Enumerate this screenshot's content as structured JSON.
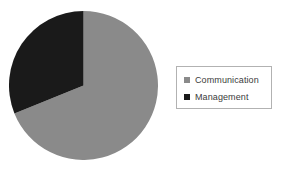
{
  "chart_data": {
    "type": "pie",
    "title": "",
    "categories": [
      "Communication",
      "Management"
    ],
    "values": [
      69,
      31
    ],
    "unit": "percent",
    "colors": [
      "#8a8a8a",
      "#1a1a1a"
    ],
    "start_angle_deg": 0,
    "direction": "clockwise",
    "slices": [
      {
        "label": "Communication",
        "value": 69,
        "color": "#8a8a8a",
        "start_angle_deg": 0,
        "sweep_angle_deg": 248
      },
      {
        "label": "Management",
        "value": 31,
        "color": "#1a1a1a",
        "start_angle_deg": 248,
        "sweep_angle_deg": 112
      }
    ],
    "legend": {
      "position": "right",
      "border": true,
      "entries": [
        {
          "label": "Communication",
          "marker": "square",
          "color": "#8a8a8a"
        },
        {
          "label": "Management",
          "marker": "square",
          "color": "#1a1a1a"
        }
      ]
    },
    "grid": false,
    "xlabel": "",
    "ylabel": "",
    "data_labels": false
  },
  "figure": {
    "background_color": "#ffffff",
    "legend_border_color": "#b2b2b2",
    "label_text_color": "#3b3b3b"
  }
}
